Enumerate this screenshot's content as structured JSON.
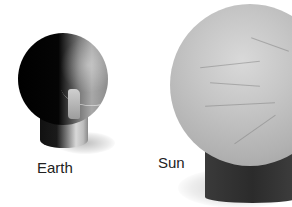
{
  "scene": {
    "description": "Photograph of two scale models: a small dark sphere on a pedestal and a much larger light-gray textured sphere on a dark pedestal",
    "models": [
      {
        "id": "earth",
        "label": "Earth",
        "sphere_color": "#0a0a0a",
        "pedestal_color": "#cfcfcf"
      },
      {
        "id": "sun",
        "label": "Sun",
        "sphere_color": "#c6c6c6",
        "pedestal_color": "#2f2f2f"
      }
    ],
    "background": "#ffffff"
  }
}
